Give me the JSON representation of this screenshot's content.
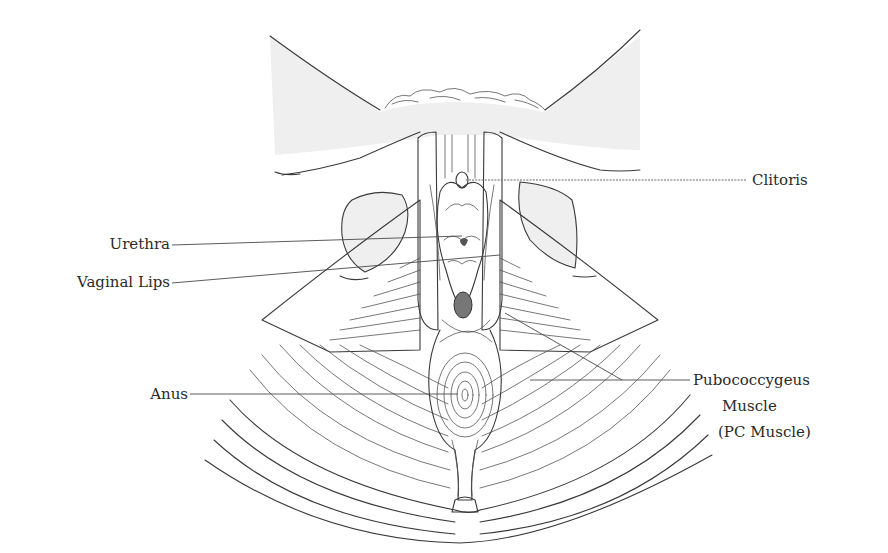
{
  "diagram": {
    "labels": {
      "clitoris": "Clitoris",
      "urethra": "Urethra",
      "vaginal_lips": "Vaginal Lips",
      "anus": "Anus",
      "pc_muscle_line1": "Pubococcygeus",
      "pc_muscle_line2": "Muscle",
      "pc_muscle_line3": "(PC Muscle)"
    },
    "leader_lines": [
      {
        "label": "Clitoris",
        "from": [
          746,
          180
        ],
        "to": [
          465,
          180
        ]
      },
      {
        "label": "Urethra",
        "from": [
          172,
          245
        ],
        "to": [
          462,
          236
        ]
      },
      {
        "label": "Vaginal Lips",
        "from": [
          172,
          283
        ],
        "to": [
          500,
          255
        ]
      },
      {
        "label": "Anus",
        "from": [
          190,
          394
        ],
        "to": [
          458,
          394
        ]
      },
      {
        "label": "Pubococcygeus Muscle (PC Muscle)",
        "from": [
          690,
          380
        ],
        "to": [
          530,
          380
        ]
      },
      {
        "label": "Pubococcygeus Muscle (PC Muscle)",
        "from": [
          622,
          380
        ],
        "to": [
          505,
          313
        ]
      }
    ],
    "colors": {
      "ink": "#3a3a3a",
      "shade": "#efefef",
      "background": "#ffffff"
    }
  }
}
